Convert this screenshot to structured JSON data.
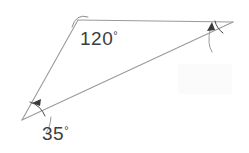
{
  "figure": {
    "type": "geometry-diagram",
    "canvas": {
      "width": 249,
      "height": 153
    },
    "background_color": "#ffffff",
    "line_color": "#9a9a9a",
    "mark_color": "#3a3a3a",
    "text_color": "#3d3d3d"
  },
  "vertices": [
    {
      "id": "A",
      "role": "top",
      "x": 78,
      "y": 20
    },
    {
      "id": "B",
      "role": "bottom-left",
      "x": 22,
      "y": 120
    },
    {
      "id": "C",
      "role": "right",
      "x": 233,
      "y": 22
    }
  ],
  "edges": [
    {
      "id": "AC",
      "from": "A",
      "to": "C",
      "path": "M 78 20 L 233 22"
    },
    {
      "id": "AB",
      "from": "A",
      "to": "B",
      "path": "M 78 20 L 22 120"
    },
    {
      "id": "BC",
      "from": "B",
      "to": "C",
      "path": "M 22 120 L 233 22"
    }
  ],
  "angles": [
    {
      "id": "angle-top",
      "at_vertex": "A",
      "value": 120,
      "label_number": "120",
      "label_degree": "°",
      "label_full": "120°",
      "label_x": 80,
      "label_y": 45,
      "marker": "arc",
      "arc_path": "M 72 27 Q 76 13 88 17",
      "has_arrow": false
    },
    {
      "id": "angle-bottom-left",
      "at_vertex": "B",
      "value": 35,
      "label_number": "35",
      "label_degree": "°",
      "label_full": "35°",
      "label_x": 42,
      "label_y": 140,
      "marker": "arc-with-arrow",
      "arc_path": "M 30 102 A 24 24 0 0 1 45 116",
      "leader_path": "M 51 117 Q 50 128 46 133",
      "arrow_tip_x": 32,
      "arrow_tip_y": 103,
      "arrow_angle_deg": 200,
      "has_arrow": true
    },
    {
      "id": "angle-right",
      "at_vertex": "C",
      "value": null,
      "label_number": "",
      "label_degree": "",
      "label_full": "",
      "label_x": 0,
      "label_y": 0,
      "marker": "arc-with-arrow",
      "arc_path": "M 215 21 A 20 20 0 0 0 223 33",
      "leader_path": "M 210 30 Q 207 44 212 52",
      "arrow_tip_x": 212,
      "arrow_tip_y": 22,
      "arrow_angle_deg": 300,
      "has_arrow": true
    }
  ],
  "watermark": {
    "present": true,
    "description": "faint light rectangular watermark block",
    "x": 178,
    "y": 64,
    "width": 54,
    "height": 30
  }
}
